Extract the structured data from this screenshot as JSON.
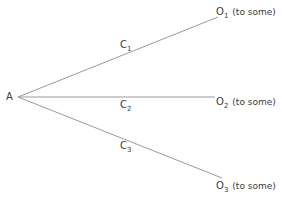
{
  "diagram": {
    "type": "branching-tree",
    "line_color": "#9a9a9a",
    "text_color": "#3a3a3a",
    "origin": {
      "label": "A"
    },
    "branches": [
      {
        "edge_label": "C",
        "edge_sub": "1",
        "target_label": "O",
        "target_sub": "1",
        "target_note": "(to some)"
      },
      {
        "edge_label": "C",
        "edge_sub": "2",
        "target_label": "O",
        "target_sub": "2",
        "target_note": "(to some)"
      },
      {
        "edge_label": "C",
        "edge_sub": "3",
        "target_label": "O",
        "target_sub": "3",
        "target_note": "(to some)"
      }
    ]
  }
}
